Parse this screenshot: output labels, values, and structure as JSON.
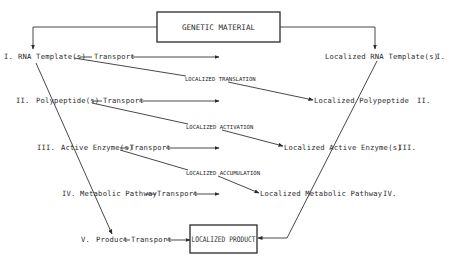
{
  "diagram": {
    "top_box": {
      "label": "GENETIC MATERIAL"
    },
    "bottom_box": {
      "label": "LOCALIZED PRODUCT"
    },
    "transport_label": "Transport",
    "left_levels": [
      {
        "numeral": "I.",
        "label": "RNA Template(s)"
      },
      {
        "numeral": "II.",
        "label": "Polypeptide(s)"
      },
      {
        "numeral": "III.",
        "label": "Active Enzyme(s)"
      },
      {
        "numeral": "IV.",
        "label": "Metabolic Pathway"
      },
      {
        "numeral": "V.",
        "label": "Product"
      }
    ],
    "right_levels": [
      {
        "numeral": "I.",
        "label": "Localized RNA Template(s)"
      },
      {
        "numeral": "II.",
        "label": "Localized Polypeptide"
      },
      {
        "numeral": "III.",
        "label": "Localized Active Enzyme(s)"
      },
      {
        "numeral": "IV.",
        "label": "Localized Metabolic Pathway"
      }
    ],
    "cross_labels": [
      "LOCALIZED TRANSLATION",
      "LOCALIZED ACTIVATION",
      "LOCALIZED ACCUMULATION"
    ]
  }
}
